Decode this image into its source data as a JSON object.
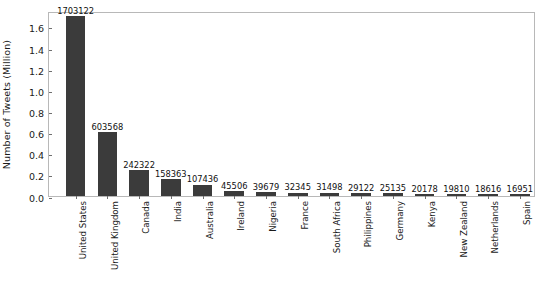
{
  "chart_data": {
    "type": "bar",
    "title": "",
    "xlabel": "",
    "ylabel": "Number of Tweets (Million)",
    "ylim": [
      0.0,
      1.75
    ],
    "yticks": [
      "0.0",
      "0.2",
      "0.4",
      "0.6",
      "0.8",
      "1.0",
      "1.2",
      "1.4",
      "1.6"
    ],
    "ytick_values": [
      0.0,
      0.2,
      0.4,
      0.6,
      0.8,
      1.0,
      1.2,
      1.4,
      1.6
    ],
    "y_units": "Million",
    "grid": false,
    "legend": false,
    "bar_color": "#3b3b3b",
    "orientation": "vertical",
    "label_rotation_degrees": 90,
    "categories": [
      "United States",
      "United Kingdom",
      "Canada",
      "India",
      "Australia",
      "Ireland",
      "Nigeria",
      "France",
      "South Africa",
      "Philippines",
      "Germany",
      "Kenya",
      "New Zealand",
      "Netherlands",
      "Spain"
    ],
    "values": [
      1703122,
      603568,
      242322,
      158363,
      107436,
      45506,
      39679,
      32345,
      31498,
      29122,
      25135,
      20178,
      19810,
      18616,
      16951
    ],
    "value_labels": [
      "1703122",
      "603568",
      "242322",
      "158363",
      "107436",
      "45506",
      "39679",
      "32345",
      "31498",
      "29122",
      "25135",
      "20178",
      "19810",
      "18616",
      "16951"
    ]
  }
}
